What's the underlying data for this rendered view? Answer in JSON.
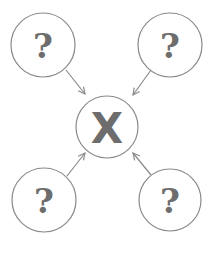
{
  "diagram": {
    "center": {
      "label": "X",
      "cx": 107,
      "cy": 127,
      "r": 31
    },
    "nodes": [
      {
        "id": "top-left",
        "label": "?",
        "cx": 43,
        "cy": 45,
        "r": 32
      },
      {
        "id": "top-right",
        "label": "?",
        "cx": 170,
        "cy": 45,
        "r": 32
      },
      {
        "id": "bottom-left",
        "label": "?",
        "cx": 44,
        "cy": 200,
        "r": 32
      },
      {
        "id": "bottom-right",
        "label": "?",
        "cx": 170,
        "cy": 200,
        "r": 31
      }
    ],
    "edges": [
      {
        "from": "top-left",
        "to": "center",
        "x1": 66,
        "y1": 70,
        "x2": 85,
        "y2": 94
      },
      {
        "from": "top-right",
        "to": "center",
        "x1": 151,
        "y1": 70,
        "x2": 133,
        "y2": 95
      },
      {
        "from": "bottom-left",
        "to": "center",
        "x1": 67,
        "y1": 176,
        "x2": 85,
        "y2": 153
      },
      {
        "from": "bottom-right",
        "to": "center",
        "x1": 151,
        "y1": 175,
        "x2": 133,
        "y2": 153
      }
    ],
    "colors": {
      "stroke": "#8a8a8a",
      "text": "#6d6d6d",
      "background": "#ffffff"
    }
  }
}
